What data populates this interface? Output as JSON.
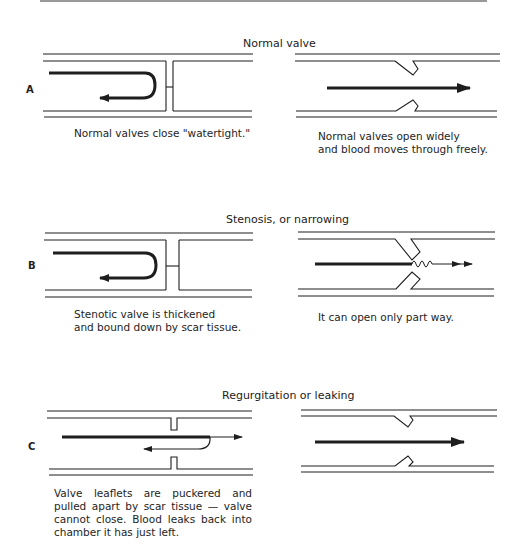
{
  "figure": {
    "panels": [
      {
        "letter": "A",
        "title": "Normal valve",
        "left_caption": "Normal valves close \"watertight.\"",
        "right_caption": "Normal valves open widely\nand blood moves through freely."
      },
      {
        "letter": "B",
        "title": "Stenosis, or narrowing",
        "left_caption": "Stenotic valve is thickened\nand bound down by scar tissue.",
        "right_caption": "It can open only part way."
      },
      {
        "letter": "C",
        "title": "Regurgitation or leaking",
        "left_caption": "Valve leaflets are puckered and pulled apart by scar tissue — valve cannot close. Blood leaks back into chamber it has just left.",
        "right_caption": ""
      }
    ],
    "colors": {
      "ink": "#1e1e1e",
      "background": "#ffffff",
      "rule": "#999999"
    }
  }
}
